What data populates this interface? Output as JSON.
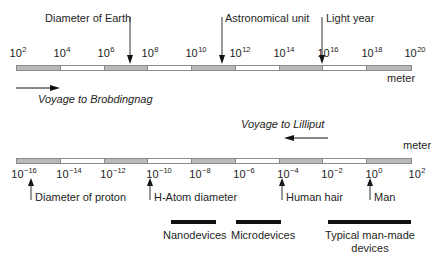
{
  "top_scale": {
    "ticks": [
      {
        "base": "10",
        "exp": "2"
      },
      {
        "base": "10",
        "exp": "4"
      },
      {
        "base": "10",
        "exp": "6"
      },
      {
        "base": "10",
        "exp": "8"
      },
      {
        "base": "10",
        "exp": "10"
      },
      {
        "base": "10",
        "exp": "12"
      },
      {
        "base": "10",
        "exp": "14"
      },
      {
        "base": "10",
        "exp": "16"
      },
      {
        "base": "10",
        "exp": "18"
      },
      {
        "base": "10",
        "exp": "20"
      }
    ],
    "unit": "meter",
    "markers": [
      {
        "label": "Diameter of Earth"
      },
      {
        "label": "Astronomical unit"
      },
      {
        "label": "Light year"
      }
    ],
    "direction_label": "Voyage to Brobdingnag"
  },
  "bottom_scale": {
    "ticks": [
      {
        "base": "10",
        "exp": "−16"
      },
      {
        "base": "10",
        "exp": "−14"
      },
      {
        "base": "10",
        "exp": "−12"
      },
      {
        "base": "10",
        "exp": "−10"
      },
      {
        "base": "10",
        "exp": "−8"
      },
      {
        "base": "10",
        "exp": "−6"
      },
      {
        "base": "10",
        "exp": "−4"
      },
      {
        "base": "10",
        "exp": "−2"
      },
      {
        "base": "10",
        "exp": "0"
      },
      {
        "base": "10",
        "exp": "2"
      }
    ],
    "unit": "meter",
    "markers": [
      {
        "label": "Diameter of proton"
      },
      {
        "label": "H-Atom diameter"
      },
      {
        "label": "Human hair"
      },
      {
        "label": "Man"
      }
    ],
    "direction_label": "Voyage to Lilliput"
  },
  "ranges": [
    {
      "label": "Nanodevices"
    },
    {
      "label": "Microdevices"
    },
    {
      "label_line1": "Typical man-made",
      "label_line2": "devices"
    }
  ],
  "colors": {
    "shaded_segment": "#b9b9b9",
    "ink": "#111111"
  }
}
